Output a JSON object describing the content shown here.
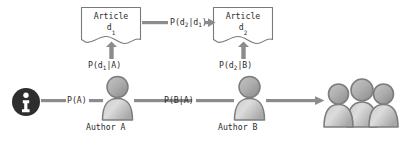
{
  "diagram": {
    "colors": {
      "arrow": "#8c8c8c",
      "arrow_dark": "#6f6f6f",
      "outline": "#7a7a7a",
      "text": "#2b2b2b",
      "person_light": "#d9d9d9",
      "person_mid": "#b4b4b4",
      "person_dark": "#8f8f8f",
      "info_icon": "#2e2e2e",
      "background": "#ffffff"
    },
    "nodes": {
      "source": {
        "icon": "info-icon",
        "label": ""
      },
      "author_a": {
        "label": "Author A",
        "icon": "person-icon"
      },
      "author_b": {
        "label": "Author B",
        "icon": "person-icon"
      },
      "audience": {
        "label": "",
        "icon": "people-group-icon"
      },
      "article_1": {
        "title": "Article",
        "id": "d",
        "sub": "1"
      },
      "article_2": {
        "title": "Article",
        "id": "d",
        "sub": "2"
      }
    },
    "edges": {
      "source_to_a": {
        "label": "P(A)",
        "kind": "horizontal-arrow"
      },
      "a_to_b": {
        "label": "P(B|A)",
        "kind": "horizontal-arrow"
      },
      "b_to_audience": {
        "label": "",
        "kind": "horizontal-arrow"
      },
      "a_to_article1": {
        "label_main": "P(d",
        "label_sub": "1",
        "label_tail": "|A)",
        "kind": "vertical-arrow"
      },
      "b_to_article2": {
        "label_main": "P(d",
        "label_sub": "2",
        "label_tail": "|B)",
        "kind": "vertical-arrow"
      },
      "article1_to_article2": {
        "label_main": "P(d",
        "label_sub1": "2",
        "label_mid": "|d",
        "label_sub2": "1",
        "label_tail": ")",
        "kind": "horizontal-arrow"
      }
    }
  }
}
